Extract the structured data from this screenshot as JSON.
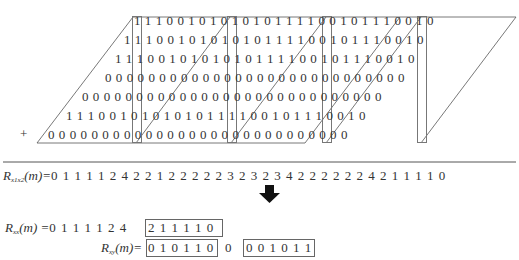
{
  "figure": {
    "rows": [
      {
        "digits": "1110010101010111100101110010",
        "start_col": 0
      },
      {
        "digits": "1110010101010111100101110010",
        "start_col": -1
      },
      {
        "digits": "1110010101010111100101110010",
        "start_col": -2
      },
      {
        "digits": "0000000000000000000000000000",
        "start_col": -3
      },
      {
        "digits": "0000000000000000000000000000",
        "start_col": -4
      },
      {
        "digits": "1110010101010111100101110010",
        "start_col": -5
      },
      {
        "digits": "0000000000000000000000000000",
        "start_col": -10
      }
    ],
    "row_strings": [
      "1 1 1 0 0 1 0 1 0 1 0 1 0 1 1 1 1 0 0 1 0 1 1 1 0 0 1 0",
      "1 1 1 0 0 1 0 1 0 1 0 1 0 1 1 1 1 0 0 1 0 1 1 1 0 0 1 0",
      "1 1 1 0 0 1 0 1 0 1 0 1 0 1 1 1 1 0 0 1 0 1 1 1 0 0 1 0",
      "0 0 0 0 0 0 0 0 0 0 0 0 0 0 0 0 0 0 0 0 0 0 0 0 0 0 0 0",
      "0 0 0 0 0 0 0 0 0 0 0 0 0 0 0 0 0 0 0 0 0 0 0 0 0 0 0 0",
      "1 1 1 0 0 1 0 1 0 1 0 1 0 1 1 1 1 0 0 1 0 1 1 1 0 0 1 0",
      "0 0 0 0 0 0 0 0 0 0 0 0 0 0 0 0 0 0 0 0 0 0 0 0 0 0 0 0"
    ],
    "plus_sign": "+",
    "sum_label": "R",
    "sum_subscript": "x1x2",
    "sum_arg": "(m)=",
    "sum_values": "0 1 1 1 1 2 4 2 2 1 2 2 2 2 2 3 2 3 2 3 4 2 2 2 2 2 2 4 2 1 1 1 1 0",
    "arrow": "down-arrow",
    "rxx": {
      "label": "R",
      "subscript": "xx",
      "arg": "(m) =",
      "prefix_values": "0 1 1 1 1 2 4",
      "boxed_values": "2 1 1 1 1 0"
    },
    "rxy": {
      "label": "R",
      "subscript": "xy",
      "arg": "(m)=",
      "boxed_values_1": "0 1 0 1 1 0",
      "middle_value": "0",
      "boxed_values_2": "0 0 1 0 1 1"
    },
    "colors": {
      "text": "#4a4a4a",
      "lines": "#555555",
      "boxes": "#888888",
      "arrow": "#111111"
    }
  }
}
